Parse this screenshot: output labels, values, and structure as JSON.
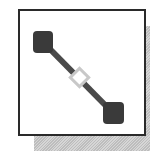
{
  "icon": {
    "name": "connector-line-tool",
    "description": "Framed icon showing a diagonal line connecting two endpoints with a midpoint handle",
    "colors": {
      "frame": "#2a2a2a",
      "endpoint": "#3a3a3a",
      "line": "#4a4a4a",
      "midpoint_handle": "#c8c8c8",
      "shadow": "#c8c8c8",
      "background": "#ffffff"
    },
    "endpoints": [
      {
        "x": 43,
        "y": 42
      },
      {
        "x": 113,
        "y": 113
      }
    ],
    "midpoint": {
      "x": 80,
      "y": 78
    }
  }
}
